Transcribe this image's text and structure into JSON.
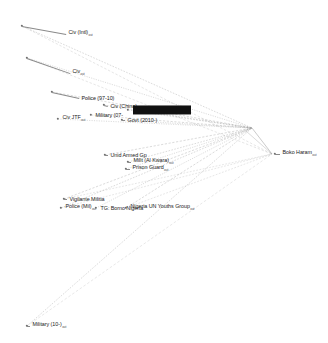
{
  "figure": {
    "type": "network-graph",
    "title": "",
    "background": "#ffffff",
    "edge_color": "#9a9a9a",
    "node_color": "#6f6f6f",
    "label_color": "#1a1a1a",
    "highlight_color": "#111111",
    "suffix": "out",
    "width": 328,
    "height": 343
  },
  "nodes": [
    {
      "id": "civ-intl",
      "label": "Civ (Intl)",
      "sub": "out",
      "x": 22,
      "y": 26,
      "lx": 66,
      "ly": 34,
      "highlight": false,
      "bold": false
    },
    {
      "id": "civ",
      "label": "Civ",
      "sub": "out",
      "x": 27,
      "y": 58,
      "lx": 70,
      "ly": 73,
      "highlight": false,
      "bold": false
    },
    {
      "id": "police-97-10",
      "label": "Police (97-10)",
      "sub": "",
      "x": 52,
      "y": 92,
      "lx": 79,
      "ly": 98,
      "highlight": false,
      "bold": false
    },
    {
      "id": "civ-china",
      "label": "Civ (China)",
      "sub": "",
      "x": 104,
      "y": 105,
      "lx": 108,
      "ly": 106,
      "highlight": false,
      "bold": false
    },
    {
      "id": "civ-jtf",
      "label": "Civ JTF",
      "sub": "out",
      "x": 58,
      "y": 119,
      "lx": 60,
      "ly": 119,
      "highlight": false,
      "bold": false
    },
    {
      "id": "military-07",
      "label": "Military (07-",
      "sub": "",
      "x": 91,
      "y": 115,
      "lx": 93,
      "ly": 115,
      "highlight": false,
      "bold": false
    },
    {
      "id": "overlap-hl",
      "label": "Militia (Kwara) Press",
      "sub": "out",
      "x": 128,
      "y": 110,
      "lx": 130,
      "ly": 110,
      "highlight": true,
      "bold": true
    },
    {
      "id": "govt-2010",
      "label": "Govt (2010-)",
      "sub": "",
      "x": 122,
      "y": 120,
      "lx": 125,
      "ly": 120,
      "highlight": false,
      "bold": false
    },
    {
      "id": "unid-armed-gp",
      "label": "Unid Armed Gp",
      "sub": "",
      "x": 105,
      "y": 155,
      "lx": 108,
      "ly": 155,
      "highlight": false,
      "bold": false
    },
    {
      "id": "milit-al-kwara",
      "label": "Milit (Al Kwara)",
      "sub": "out",
      "x": 128,
      "y": 162,
      "lx": 131,
      "ly": 162,
      "highlight": false,
      "bold": false
    },
    {
      "id": "prison-guard",
      "label": "Prison Guard",
      "sub": "out",
      "x": 126,
      "y": 169,
      "lx": 130,
      "ly": 169,
      "highlight": false,
      "bold": false
    },
    {
      "id": "vigilante",
      "label": "Vigilante Militia",
      "sub": "",
      "x": 64,
      "y": 199,
      "lx": 67,
      "ly": 199,
      "highlight": false,
      "bold": false
    },
    {
      "id": "police-mil",
      "label": "Police (Mil)",
      "sub": "out",
      "x": 61,
      "y": 208,
      "lx": 63,
      "ly": 208,
      "highlight": false,
      "bold": false
    },
    {
      "id": "tg-borno",
      "label": "TG: Borno Nigeria",
      "sub": "",
      "x": 96,
      "y": 208,
      "lx": 98,
      "ly": 208,
      "highlight": false,
      "bold": false
    },
    {
      "id": "youths-group",
      "label": "Nigeria UN Youths Group",
      "sub": "out",
      "x": 126,
      "y": 208,
      "lx": 128,
      "ly": 208,
      "highlight": false,
      "bold": false
    },
    {
      "id": "military-10",
      "label": "Military (10-)",
      "sub": "out",
      "x": 27,
      "y": 326,
      "lx": 30,
      "ly": 326,
      "highlight": false,
      "bold": false
    },
    {
      "id": "boko-haram",
      "label": "Boko Haram",
      "sub": "out",
      "x": 275,
      "y": 154,
      "lx": 280,
      "ly": 154,
      "highlight": false,
      "bold": false
    }
  ],
  "hub": {
    "id": "convergence-point",
    "x": 252,
    "y": 128
  },
  "edges": [
    {
      "from": "civ-intl",
      "to": "boko-haram"
    },
    {
      "from": "civ",
      "to": "boko-haram"
    },
    {
      "from": "police-97-10",
      "to": "boko-haram"
    },
    {
      "from": "civ-china",
      "to": "boko-haram"
    },
    {
      "from": "civ-jtf",
      "to": "boko-haram"
    },
    {
      "from": "military-07",
      "to": "boko-haram"
    },
    {
      "from": "overlap-hl",
      "to": "boko-haram"
    },
    {
      "from": "govt-2010",
      "to": "boko-haram"
    },
    {
      "from": "unid-armed-gp",
      "to": "boko-haram"
    },
    {
      "from": "milit-al-kwara",
      "to": "boko-haram"
    },
    {
      "from": "prison-guard",
      "to": "boko-haram"
    },
    {
      "from": "vigilante",
      "to": "boko-haram"
    },
    {
      "from": "police-mil",
      "to": "boko-haram"
    },
    {
      "from": "tg-borno",
      "to": "boko-haram"
    },
    {
      "from": "youths-group",
      "to": "boko-haram"
    },
    {
      "from": "military-10",
      "to": "boko-haram"
    }
  ]
}
